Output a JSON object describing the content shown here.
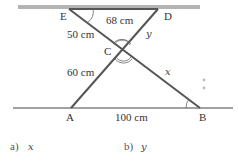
{
  "diagram": {
    "points": {
      "E": {
        "label": "E",
        "x": 69,
        "y": 10
      },
      "D": {
        "label": "D",
        "x": 158,
        "y": 10
      },
      "C": {
        "label": "C",
        "x": 122,
        "y": 50
      },
      "A": {
        "label": "A",
        "x": 71,
        "y": 108
      },
      "B": {
        "label": "B",
        "x": 200,
        "y": 108
      }
    },
    "segment_labels": {
      "ED": "68 cm",
      "EC": "50 cm",
      "CD": "y",
      "AC": "60 cm",
      "CB": "x",
      "AB": "100 cm"
    },
    "colors": {
      "top_bar": "#b3b3b3",
      "segments": "#555555",
      "baseline": "#444444",
      "dots": "#bbbbbb"
    }
  },
  "questions": [
    {
      "prefix": "a)",
      "var": "x"
    },
    {
      "prefix": "b)",
      "var": "y"
    }
  ]
}
